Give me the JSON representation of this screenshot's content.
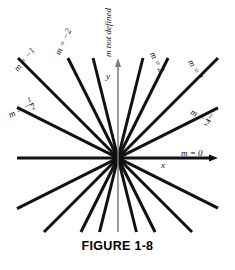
{
  "figure": {
    "caption": "FIGURE 1-8",
    "origin": {
      "x": 118,
      "y": 158
    },
    "axes": {
      "x_label": "x",
      "y_label": "y",
      "x_slope_label": "m = 0",
      "y_slope_label": "m not defined",
      "axis_color": "#7a7a7a",
      "line_color": "#111111"
    },
    "lines": [
      {
        "name": "slope-0",
        "slope": 0,
        "label": "m = 0",
        "label_sign": "",
        "label_num": "0",
        "label_den": "",
        "angle_deg": 0,
        "labeled": true,
        "is_axis": true
      },
      {
        "name": "slope-one-half",
        "slope": 0.5,
        "label": "m = 1/2",
        "label_sign": "",
        "label_num": "1",
        "label_den": "2",
        "angle_deg": 26.6,
        "labeled": true,
        "is_axis": false
      },
      {
        "name": "slope-1",
        "slope": 1,
        "label": "m = 1",
        "label_sign": "",
        "label_num": "1",
        "label_den": "",
        "angle_deg": 45,
        "labeled": true,
        "is_axis": false
      },
      {
        "name": "slope-2",
        "slope": 2,
        "label": "m = 2",
        "label_sign": "",
        "label_num": "2",
        "label_den": "",
        "angle_deg": 63.4,
        "labeled": true,
        "is_axis": false
      },
      {
        "name": "slope-4",
        "slope": 4,
        "label": "",
        "label_sign": "",
        "label_num": "",
        "label_den": "",
        "angle_deg": 76,
        "labeled": false,
        "is_axis": false
      },
      {
        "name": "slope-undefined",
        "slope": null,
        "label": "m not defined",
        "label_sign": "",
        "label_num": "",
        "label_den": "",
        "angle_deg": 90,
        "labeled": true,
        "is_axis": true
      },
      {
        "name": "slope-neg-4",
        "slope": -4,
        "label": "",
        "label_sign": "",
        "label_num": "",
        "label_den": "",
        "angle_deg": 104,
        "labeled": false,
        "is_axis": false
      },
      {
        "name": "slope-neg-2",
        "slope": -2,
        "label": "m = -2",
        "label_sign": "-",
        "label_num": "2",
        "label_den": "",
        "angle_deg": 116.6,
        "labeled": true,
        "is_axis": false
      },
      {
        "name": "slope-neg-1",
        "slope": -1,
        "label": "m = -1",
        "label_sign": "-",
        "label_num": "1",
        "label_den": "",
        "angle_deg": 135,
        "labeled": true,
        "is_axis": false
      },
      {
        "name": "slope-neg-one-half",
        "slope": -0.5,
        "label": "m = -1/2",
        "label_sign": "-",
        "label_num": "1",
        "label_den": "2",
        "angle_deg": 153.4,
        "labeled": true,
        "is_axis": false
      }
    ],
    "labels": [
      {
        "name": "label-slope-neg-1",
        "prefix": "m = ",
        "sign": "−",
        "num": "1",
        "den": "",
        "x": 16,
        "y": 66,
        "rotate": -51
      },
      {
        "name": "label-slope-neg-2",
        "prefix": "m = ",
        "sign": "−",
        "num": "2",
        "den": "",
        "x": 58,
        "y": 50,
        "rotate": -66
      },
      {
        "name": "label-slope-neg-one-half",
        "prefix": "m = ",
        "sign": "−",
        "num": "1",
        "den": "2",
        "x": 9,
        "y": 108,
        "rotate": -27
      },
      {
        "name": "label-slope-2",
        "prefix": "m = ",
        "sign": "",
        "num": "2",
        "den": "",
        "x": 152,
        "y": 48,
        "rotate": 63
      },
      {
        "name": "label-slope-1",
        "prefix": "m = ",
        "sign": "",
        "num": "1",
        "den": "",
        "x": 190,
        "y": 56,
        "rotate": 60
      },
      {
        "name": "label-slope-one-half",
        "prefix": "m = ",
        "sign": "",
        "num": "1",
        "den": "2",
        "x": 191,
        "y": 104,
        "rotate": 27
      }
    ]
  }
}
